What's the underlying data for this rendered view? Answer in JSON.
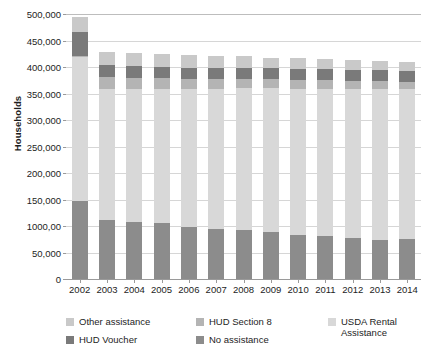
{
  "figure": {
    "cropped_title": "",
    "background": "#ffffff"
  },
  "chart_data": {
    "type": "bar",
    "subtype": "stacked-vertical",
    "title": "",
    "xlabel": "",
    "ylabel": "Households",
    "ylim": [
      0,
      500000
    ],
    "ytick_values": [
      0,
      50000,
      100000,
      150000,
      200000,
      250000,
      300000,
      350000,
      400000,
      450000,
      500000
    ],
    "ytick_labels": [
      "0",
      "50,000",
      "1000,00",
      "150,000",
      "200,000",
      "250,000",
      "300,000",
      "350,000",
      "400,000",
      "450,000",
      "500,000"
    ],
    "grid": true,
    "grid_axis": "y",
    "legend_position": "bottom",
    "categories": [
      "2002",
      "2003",
      "2004",
      "2005",
      "2006",
      "2007",
      "2008",
      "2009",
      "2010",
      "2011",
      "2012",
      "2013",
      "2014"
    ],
    "stack_order_bottom_to_top": [
      "No assistance",
      "USDA Rental Assistance",
      "HUD Section 8",
      "HUD Voucher",
      "Other assistance"
    ],
    "series": [
      {
        "name": "No assistance",
        "color": "#8c8c8c",
        "values": [
          148000,
          112000,
          107000,
          105000,
          98000,
          95000,
          92000,
          88000,
          83000,
          81000,
          78000,
          74000,
          75000
        ]
      },
      {
        "name": "USDA Rental Assistance",
        "color": "#d8d8d8",
        "values": [
          270000,
          247000,
          252000,
          253000,
          260000,
          264000,
          268000,
          272000,
          276000,
          278000,
          281000,
          285000,
          283000
        ]
      },
      {
        "name": "HUD Section 8",
        "color": "#b4b4b4",
        "values": [
          3000,
          22000,
          21000,
          21000,
          19000,
          18000,
          18000,
          17000,
          16000,
          16000,
          15000,
          15000,
          14000
        ]
      },
      {
        "name": "HUD Voucher",
        "color": "#7a7a7a",
        "values": [
          45000,
          22000,
          22000,
          21000,
          22000,
          22000,
          21000,
          21000,
          22000,
          21000,
          21000,
          20000,
          20000
        ]
      },
      {
        "name": "Other assistance",
        "color": "#c9c9c9",
        "values": [
          29000,
          25000,
          25000,
          24000,
          23000,
          22000,
          21000,
          20000,
          20000,
          19000,
          19000,
          18000,
          17000
        ]
      }
    ],
    "totals": [
      495000,
      428000,
      427000,
      424000,
      422000,
      421000,
      420000,
      418000,
      417000,
      415000,
      414000,
      412000,
      409000
    ]
  },
  "legend": {
    "entries": [
      {
        "label": "Other assistance",
        "color": "#c9c9c9"
      },
      {
        "label": "HUD Voucher",
        "color": "#7a7a7a"
      },
      {
        "label": "HUD Section 8",
        "color": "#b4b4b4"
      },
      {
        "label": "No assistance",
        "color": "#8c8c8c"
      },
      {
        "label": "USDA Rental\nAssistance",
        "color": "#d8d8d8"
      }
    ]
  }
}
